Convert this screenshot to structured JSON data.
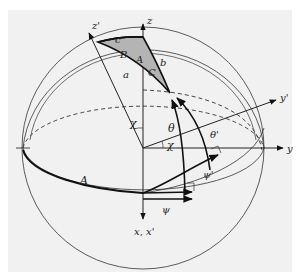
{
  "figure": {
    "background_color": "#f1f1f1",
    "line_color": "#222222",
    "triangle_fill": "#b4b4b4"
  },
  "axes": {
    "z": "z",
    "z_prime": "z'",
    "y": "y",
    "y_prime": "y'",
    "x_xprime": "x, x'"
  },
  "triangle": {
    "sides": {
      "a": "a",
      "b": "b",
      "c": "c"
    },
    "angles": {
      "A": "A",
      "B": "B",
      "C": "C"
    }
  },
  "angles": {
    "chi_upper": "χ",
    "chi_lower": "χ",
    "theta": "θ",
    "theta_prime": "θ'",
    "psi": "ψ",
    "psi_prime": "ψ'"
  },
  "arcs": {
    "A_label": "A"
  }
}
